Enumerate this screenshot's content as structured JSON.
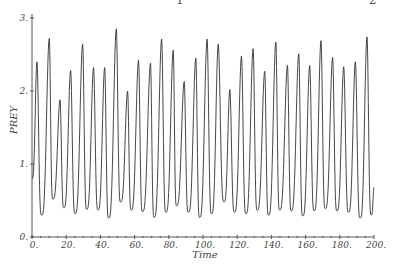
{
  "chart_data": {
    "type": "line",
    "title": "",
    "xlabel": "Time",
    "ylabel": "PREY",
    "xlim": [
      0,
      200
    ],
    "ylim": [
      0,
      3
    ],
    "grid": false,
    "legend": null,
    "x_ticks": [
      0,
      20,
      40,
      60,
      80,
      100,
      120,
      140,
      160,
      180,
      200
    ],
    "x_tick_labels": [
      "0.",
      "20.",
      "40.",
      "60.",
      "80.",
      "100.",
      "120.",
      "140.",
      "160.",
      "180.",
      "200."
    ],
    "y_ticks": [
      0,
      1,
      2,
      3
    ],
    "y_tick_labels": [
      "0.",
      "1.",
      "2.",
      "3."
    ],
    "series": [
      {
        "name": "PREY",
        "color": "#333333",
        "x": [
          0,
          2.9,
          5.6,
          10.1,
          12.2,
          16.4,
          18.6,
          22.6,
          25.2,
          29.6,
          32.0,
          36.0,
          38.6,
          42.5,
          44.8,
          49.3,
          51.8,
          55.9,
          58.0,
          62.3,
          64.6,
          69.3,
          71.4,
          75.8,
          78.3,
          82.6,
          84.5,
          89.0,
          91.4,
          95.8,
          98.0,
          102.4,
          105.0,
          108.9,
          112.3,
          115.7,
          118.4,
          122.5,
          125.1,
          129.3,
          131.7,
          136.1,
          138.3,
          142.6,
          144.8,
          149.4,
          151.6,
          156.0,
          158.3,
          162.4,
          165.0,
          169.0,
          171.5,
          175.8,
          178.3,
          182.3,
          185.1,
          189.1,
          191.9,
          195.9,
          198.4,
          200
        ],
        "y": [
          0.8,
          2.4,
          0.3,
          2.72,
          0.52,
          1.88,
          0.4,
          2.28,
          0.32,
          2.64,
          0.38,
          2.32,
          0.37,
          2.32,
          0.26,
          2.85,
          0.48,
          2.0,
          0.37,
          2.42,
          0.35,
          2.38,
          0.27,
          2.71,
          0.34,
          2.56,
          0.43,
          2.13,
          0.34,
          2.45,
          0.27,
          2.71,
          0.32,
          2.64,
          0.48,
          2.02,
          0.34,
          2.48,
          0.32,
          2.58,
          0.37,
          2.27,
          0.3,
          2.67,
          0.37,
          2.35,
          0.36,
          2.51,
          0.29,
          2.35,
          0.36,
          2.69,
          0.39,
          2.46,
          0.36,
          2.33,
          0.34,
          2.4,
          0.26,
          2.74,
          0.3,
          0.68
        ]
      }
    ]
  },
  "header_fragments": [
    "1",
    "2"
  ]
}
